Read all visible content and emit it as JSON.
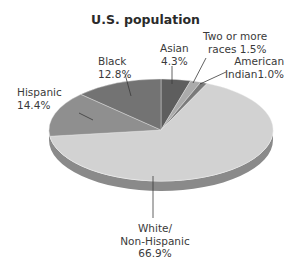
{
  "chart_data": {
    "type": "pie",
    "title": "U.S. population",
    "style": "3d-tilted",
    "start_angle": "12 o'clock",
    "direction": "clockwise",
    "slices": [
      {
        "label": "Asian",
        "value": 4.3,
        "color": "#5e5e5e"
      },
      {
        "label": "Two or more races",
        "value": 1.5,
        "color": "#ababab"
      },
      {
        "label": "American Indian",
        "value": 1.0,
        "color": "#7a7a7a"
      },
      {
        "label": "White/ Non-Hispanic",
        "value": 66.9,
        "color": "#d2d2d2"
      },
      {
        "label": "Hispanic",
        "value": 14.4,
        "color": "#8f8f8f"
      },
      {
        "label": "Black",
        "value": 12.8,
        "color": "#737373"
      }
    ],
    "side_color": "#8a8a8a",
    "unit": "%"
  },
  "labels": {
    "title": "U.S. population",
    "asian": [
      "Asian",
      "4.3%"
    ],
    "two_or_more": [
      "Two or more",
      "races 1.5%"
    ],
    "american_indian": [
      "American",
      "Indian1.0%"
    ],
    "white": [
      "White/",
      "Non-Hispanic",
      "66.9%"
    ],
    "hispanic": [
      "Hispanic",
      "14.4%"
    ],
    "black": [
      "Black",
      "12.8%"
    ]
  }
}
